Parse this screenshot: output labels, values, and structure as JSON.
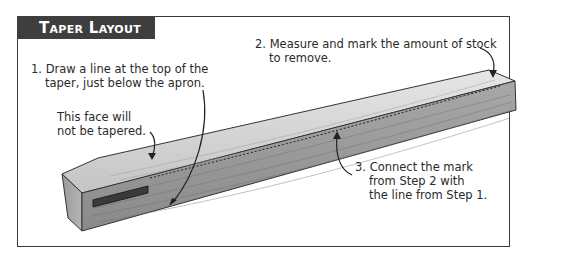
{
  "figure": {
    "title": "Taper Layout",
    "colors": {
      "title_bar": "#3e3e3e",
      "title_text": "#ffffff",
      "frame": "#3a3a3a",
      "wood_light": "#d8d8d8",
      "wood_mid": "#a9a9a9",
      "wood_dark": "#7c7c7c"
    }
  },
  "callouts": {
    "step1": {
      "line1": "1. Draw a line at the top of the",
      "line2": "taper, just below the apron."
    },
    "face_note": {
      "line1": "This face will",
      "line2": "not be tapered."
    },
    "step2": {
      "line1": "2. Measure and mark the amount of stock",
      "line2": "to remove."
    },
    "step3": {
      "line1": "3. Connect the mark",
      "line2": "from Step 2 with",
      "line3": "the line from Step 1."
    }
  },
  "illustration": {
    "subject": "table-leg-blank",
    "features": [
      "mortise",
      "dashed-taper-line",
      "wood-grain"
    ]
  }
}
